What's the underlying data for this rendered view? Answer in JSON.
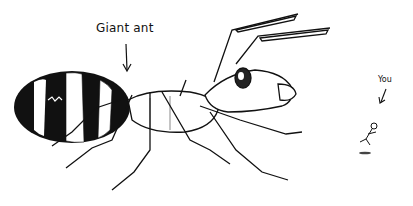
{
  "illustration": {
    "style": "black ink line drawing on white",
    "colors": {
      "ink": "#111111",
      "background": "#ffffff"
    },
    "labels": {
      "giant_ant": "Giant ant",
      "you": "You"
    },
    "subjects": [
      {
        "name": "giant-ant",
        "description": "large striped ant with antennae and legs"
      },
      {
        "name": "tiny-person",
        "description": "small figure jumping/running next to ant"
      }
    ]
  }
}
